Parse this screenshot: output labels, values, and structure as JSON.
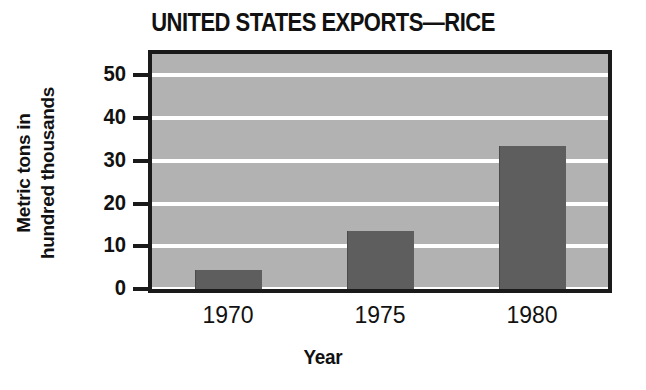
{
  "chart_data": {
    "type": "bar",
    "title": "UNITED STATES EXPORTS—RICE",
    "xlabel": "Year",
    "ylabel_line1": "Metric tons in",
    "ylabel_line2": "hundred thousands",
    "categories": [
      "1970",
      "1975",
      "1980"
    ],
    "values": [
      4.5,
      13.5,
      33.5
    ],
    "ytick_labels": [
      "0",
      "10",
      "20",
      "30",
      "40",
      "50"
    ],
    "ytick_values": [
      0,
      10,
      20,
      30,
      40,
      50
    ],
    "ylim": [
      0,
      55
    ],
    "grid": true,
    "grid_color": "#ffffff",
    "legend": "none",
    "bar_color": "#5e5e5e",
    "plot_background": "#b2b2b2",
    "frame_color": "#1a1a1a",
    "text_color": "#111111"
  }
}
